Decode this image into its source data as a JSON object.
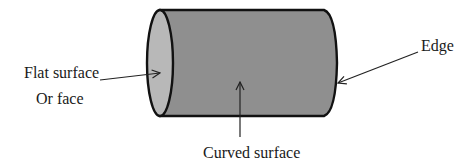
{
  "diagram": {
    "labels": {
      "flat_surface": "Flat surface",
      "or_face": "Or face",
      "curved_surface": "Curved surface",
      "edge": "Edge"
    },
    "colors": {
      "body": "#8f8f8f",
      "face": "#b8b8b8",
      "outline": "#111111",
      "text": "#1a1a1a"
    }
  }
}
